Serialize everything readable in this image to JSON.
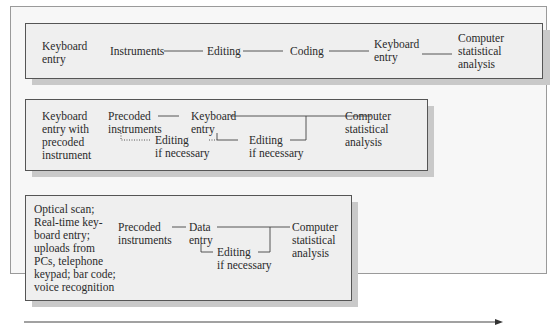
{
  "diagram": {
    "type": "data-entry-flow-comparison",
    "colors": {
      "box_fill": "#efefef",
      "box_border": "#555555",
      "shadow": "#c9c9c9",
      "frame_fill": "#f7f7f7",
      "line": "#444444"
    },
    "rows": [
      {
        "method": [
          "Keyboard",
          "entry"
        ],
        "steps": [
          {
            "id": "instruments",
            "lines": [
              "Instruments"
            ]
          },
          {
            "id": "editing",
            "lines": [
              "Editing"
            ]
          },
          {
            "id": "coding",
            "lines": [
              "Coding"
            ]
          },
          {
            "id": "keyboard-entry",
            "lines": [
              "Keyboard",
              "entry"
            ]
          },
          {
            "id": "analysis",
            "lines": [
              "Computer",
              "statistical",
              "analysis"
            ]
          }
        ]
      },
      {
        "method": [
          "Keyboard",
          "entry with",
          "precoded",
          "instrument"
        ],
        "steps": [
          {
            "id": "precoded-instruments",
            "lines": [
              "Precoded",
              "instruments"
            ]
          },
          {
            "id": "keyboard-entry",
            "lines": [
              "Keyboard",
              "entry"
            ]
          },
          {
            "id": "editing-1",
            "lines": [
              "Editing",
              "if necessary"
            ]
          },
          {
            "id": "editing-2",
            "lines": [
              "Editing",
              "if necessary"
            ]
          },
          {
            "id": "analysis",
            "lines": [
              "Computer",
              "statistical",
              "analysis"
            ]
          }
        ]
      },
      {
        "method": [
          "Optical scan;",
          "Real-time key-",
          "board entry;",
          "uploads from",
          "PCs, telephone",
          "keypad; bar code;",
          "voice recognition"
        ],
        "steps": [
          {
            "id": "precoded-instruments",
            "lines": [
              "Precoded",
              "instruments"
            ]
          },
          {
            "id": "data-entry",
            "lines": [
              "Data",
              "entry"
            ]
          },
          {
            "id": "editing",
            "lines": [
              "Editing",
              "if necessary"
            ]
          },
          {
            "id": "analysis",
            "lines": [
              "Computer",
              "statistical",
              "analysis"
            ]
          }
        ]
      }
    ],
    "timeline_arrow": {
      "direction": "right"
    }
  }
}
